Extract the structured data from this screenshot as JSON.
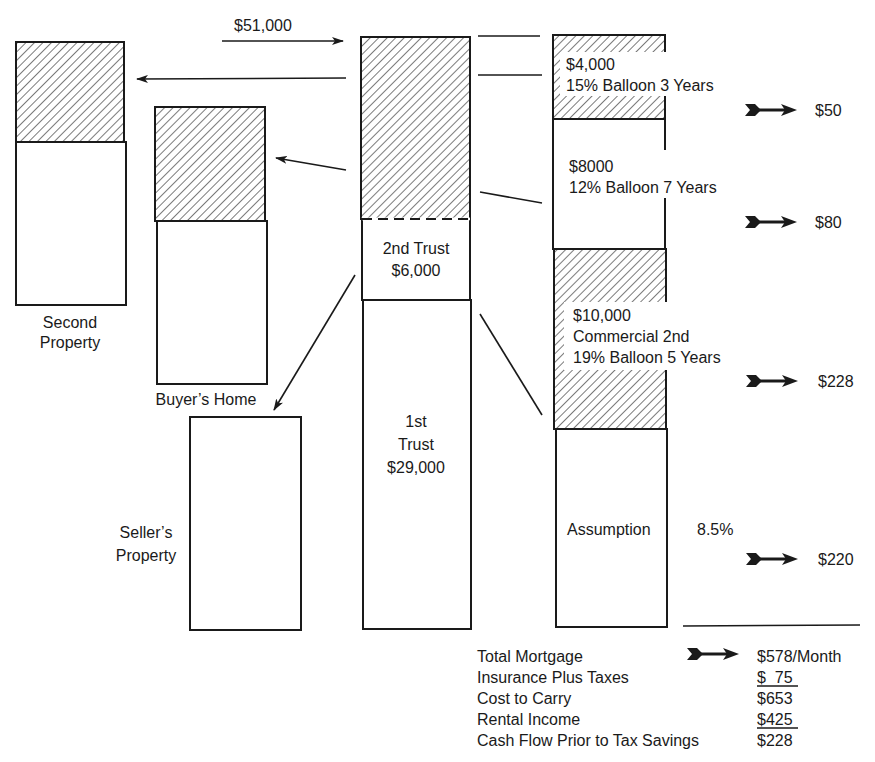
{
  "flow": {
    "amount_label": "$51,000"
  },
  "properties": {
    "second_property": {
      "label_line1": "Second",
      "label_line2": "Property"
    },
    "buyers_home": {
      "label": "Buyer’s Home"
    },
    "sellers_property": {
      "label_line1": "Seller’s",
      "label_line2": "Property"
    }
  },
  "center_column": {
    "second_trust": {
      "line1": "2nd Trust",
      "line2": "$6,000"
    },
    "first_trust": {
      "line1": "1st",
      "line2": "Trust",
      "line3": "$29,000"
    }
  },
  "right_column": {
    "loans": [
      {
        "amount": "$4,000",
        "terms": "15% Balloon 3 Years",
        "payment": "$50"
      },
      {
        "amount": "$8000",
        "terms": "12% Balloon 7 Years",
        "payment": "$80"
      },
      {
        "amount": "$10,000",
        "type": "Commercial 2nd",
        "terms": "19% Balloon 5 Years",
        "payment": "$228"
      },
      {
        "label": "Assumption",
        "rate": "8.5%",
        "payment": "$220"
      }
    ]
  },
  "summary": {
    "rows": [
      {
        "label": "Total Mortgage",
        "value": "$578/Month"
      },
      {
        "label": "Insurance Plus Taxes",
        "value": "$  75"
      },
      {
        "label": "Cost to Carry",
        "value": "$653"
      },
      {
        "label": "Rental Income",
        "value": "$425"
      },
      {
        "label": "Cash Flow Prior to Tax Savings",
        "value": "$228"
      }
    ]
  },
  "colors": {
    "ink": "#1a1a1a",
    "background": "#ffffff"
  }
}
